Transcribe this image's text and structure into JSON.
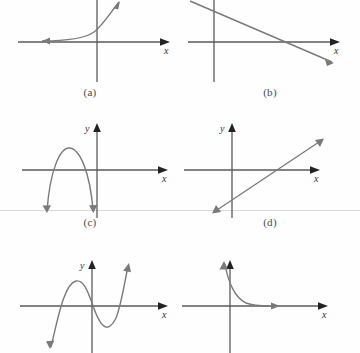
{
  "figure": {
    "panel_count": 6,
    "grid": {
      "columns": 2,
      "rows": 3
    },
    "ink_color": "#7a7a7a",
    "axis_color": "#5a5a5a",
    "arrow_color": "#222222",
    "caption_color": "#4a4a4a",
    "scan_rule_color": "#d9d9d9",
    "background": "#fefefe"
  },
  "axis_labels": {
    "x": "x",
    "y": "y"
  },
  "panels": [
    {
      "id": "a",
      "caption": "(a)",
      "curve_type": "exponential-growth",
      "description": "Increasing exponential curve approaching the x-axis on the left and rising steeply on the right",
      "shows_y_label": false,
      "shows_x_label": true
    },
    {
      "id": "b",
      "caption": "(b)",
      "curve_type": "line-negative-slope",
      "description": "Straight line with negative slope descending from upper left to lower right",
      "shows_y_label": false,
      "shows_x_label": true
    },
    {
      "id": "c",
      "caption": "(c)",
      "curve_type": "parabola-opening-down",
      "description": "Downward opening parabola with vertex above the x-axis in the second quadrant and two x-intercepts",
      "shows_y_label": true,
      "shows_x_label": true
    },
    {
      "id": "d",
      "caption": "(d)",
      "curve_type": "line-positive-slope",
      "description": "Straight line with positive slope rising from lower left to upper right",
      "shows_y_label": true,
      "shows_x_label": true
    },
    {
      "id": "e",
      "caption": "(e)",
      "curve_type": "cubic",
      "description": "Cubic curve with a local maximum left of the y-axis and a local minimum right of it, three x-intercepts",
      "shows_y_label": true,
      "shows_x_label": true
    },
    {
      "id": "f",
      "caption": "(f)",
      "curve_type": "exponential-decay",
      "description": "Decaying curve falling steeply near the y-axis then flattening toward the x-axis",
      "shows_y_label": false,
      "shows_x_label": true
    }
  ]
}
